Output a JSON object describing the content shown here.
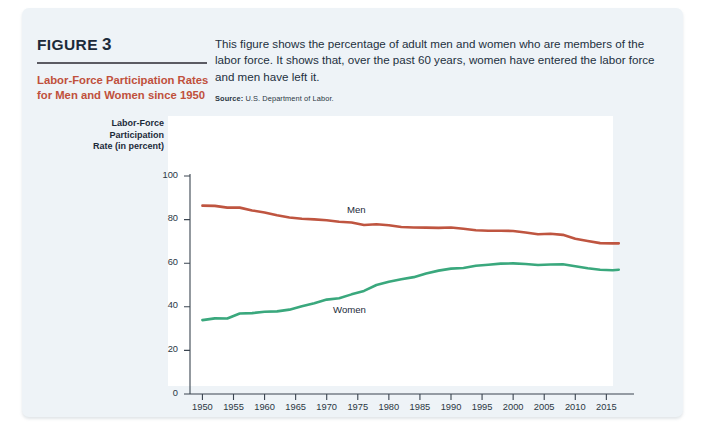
{
  "figure": {
    "label": "FIGURE",
    "number": "3",
    "title": "Labor-Force Participation Rates for Men and Women since 1950",
    "title_color": "#c0503c"
  },
  "description": {
    "body": "This figure shows the percentage of adult men and women who are members of the labor force. It shows that, over the past 60 years, women have entered the labor force and men have left it.",
    "source_label": "Source:",
    "source_value": "U.S. Department of Labor."
  },
  "chart_data": {
    "type": "line",
    "title": "Labor-Force Participation Rates for Men and Women since 1950",
    "xlabel": "",
    "ylabel": "Labor-Force Participation Rate (in percent)",
    "ylabel_lines": [
      "Labor-Force",
      "Participation",
      "Rate (in percent)"
    ],
    "xlim": [
      1948,
      2018
    ],
    "ylim": [
      0,
      100
    ],
    "grid": false,
    "legend": "inline-annotations",
    "yticks": [
      0,
      20,
      40,
      60,
      80,
      100
    ],
    "ytick_labels": [
      "0",
      "20",
      "40",
      "60",
      "80",
      "100"
    ],
    "xticks": [
      1950,
      1955,
      1960,
      1965,
      1970,
      1975,
      1980,
      1985,
      1990,
      1995,
      2000,
      2005,
      2010,
      2015
    ],
    "xtick_labels": [
      "1950",
      "1955",
      "1960",
      "1965",
      "1970",
      "1975",
      "1980",
      "1985",
      "1990",
      "1995",
      "2000",
      "2005",
      "2010",
      "2015"
    ],
    "series": [
      {
        "name": "Men",
        "color": "#bf5540",
        "annotation": "Men",
        "x": [
          1950,
          1952,
          1954,
          1956,
          1958,
          1960,
          1962,
          1964,
          1966,
          1968,
          1970,
          1972,
          1974,
          1976,
          1978,
          1980,
          1982,
          1984,
          1986,
          1988,
          1990,
          1992,
          1994,
          1996,
          1998,
          2000,
          2002,
          2004,
          2006,
          2008,
          2010,
          2012,
          2014,
          2016,
          2017
        ],
        "values": [
          86.4,
          86.3,
          85.5,
          85.5,
          84.2,
          83.3,
          82.0,
          81.0,
          80.4,
          80.1,
          79.7,
          79.0,
          78.7,
          77.5,
          77.9,
          77.4,
          76.6,
          76.4,
          76.3,
          76.2,
          76.4,
          75.8,
          75.1,
          74.9,
          74.9,
          74.8,
          74.1,
          73.3,
          73.5,
          73.0,
          71.2,
          70.2,
          69.2,
          69.1,
          69.1
        ]
      },
      {
        "name": "Women",
        "color": "#3aa87d",
        "annotation": "Women",
        "x": [
          1950,
          1952,
          1954,
          1956,
          1958,
          1960,
          1962,
          1964,
          1966,
          1968,
          1970,
          1972,
          1974,
          1976,
          1978,
          1980,
          1982,
          1984,
          1986,
          1988,
          1990,
          1992,
          1994,
          1996,
          1998,
          2000,
          2002,
          2004,
          2006,
          2008,
          2010,
          2012,
          2014,
          2016,
          2017
        ],
        "values": [
          33.9,
          34.7,
          34.6,
          36.9,
          37.1,
          37.7,
          37.9,
          38.7,
          40.3,
          41.6,
          43.3,
          43.9,
          45.7,
          47.3,
          50.0,
          51.5,
          52.6,
          53.6,
          55.3,
          56.6,
          57.5,
          57.8,
          58.8,
          59.3,
          59.8,
          59.9,
          59.6,
          59.2,
          59.4,
          59.5,
          58.6,
          57.7,
          57.0,
          56.8,
          57.0
        ]
      }
    ]
  }
}
